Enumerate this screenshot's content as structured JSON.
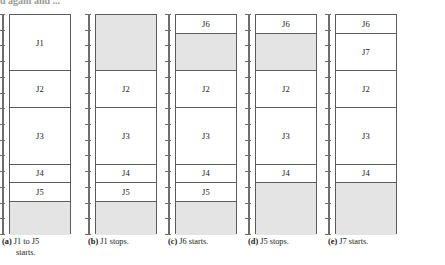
{
  "figure": {
    "top_cut_text": "d again and ...",
    "axis": {
      "tick_count": 14,
      "line_color": "#6d6d6d"
    },
    "colors": {
      "free_block": "#e4e4e4",
      "used_block": "#ffffff",
      "border": "#5c5c5c"
    },
    "memory_total_units": 14,
    "panels": [
      {
        "id": "a",
        "caption_label": "(a)",
        "caption_line1": "J1 to J5",
        "caption_line2": "starts.",
        "blocks": [
          {
            "label": "J1",
            "state": "used",
            "top_pct": 0.0,
            "height_pct": 25.5
          },
          {
            "label": "J2",
            "state": "used",
            "top_pct": 25.5,
            "height_pct": 17.0
          },
          {
            "label": "J3",
            "state": "used",
            "top_pct": 42.5,
            "height_pct": 25.5
          },
          {
            "label": "J4",
            "state": "used",
            "top_pct": 68.0,
            "height_pct": 8.5
          },
          {
            "label": "J5",
            "state": "used",
            "top_pct": 76.5,
            "height_pct": 8.5
          },
          {
            "label": "",
            "state": "free",
            "top_pct": 85.0,
            "height_pct": 15.0
          }
        ]
      },
      {
        "id": "b",
        "caption_label": "(b)",
        "caption_line1": "J1 stops.",
        "caption_line2": "",
        "blocks": [
          {
            "label": "",
            "state": "free",
            "top_pct": 0.0,
            "height_pct": 25.5
          },
          {
            "label": "J2",
            "state": "used",
            "top_pct": 25.5,
            "height_pct": 17.0
          },
          {
            "label": "J3",
            "state": "used",
            "top_pct": 42.5,
            "height_pct": 25.5
          },
          {
            "label": "J4",
            "state": "used",
            "top_pct": 68.0,
            "height_pct": 8.5
          },
          {
            "label": "J5",
            "state": "used",
            "top_pct": 76.5,
            "height_pct": 8.5
          },
          {
            "label": "",
            "state": "free",
            "top_pct": 85.0,
            "height_pct": 15.0
          }
        ]
      },
      {
        "id": "c",
        "caption_label": "(c)",
        "caption_line1": "J6 starts.",
        "caption_line2": "",
        "blocks": [
          {
            "label": "J6",
            "state": "used",
            "top_pct": 0.0,
            "height_pct": 8.5
          },
          {
            "label": "",
            "state": "free",
            "top_pct": 8.5,
            "height_pct": 17.0
          },
          {
            "label": "J2",
            "state": "used",
            "top_pct": 25.5,
            "height_pct": 17.0
          },
          {
            "label": "J3",
            "state": "used",
            "top_pct": 42.5,
            "height_pct": 25.5
          },
          {
            "label": "J4",
            "state": "used",
            "top_pct": 68.0,
            "height_pct": 8.5
          },
          {
            "label": "J5",
            "state": "used",
            "top_pct": 76.5,
            "height_pct": 8.5
          },
          {
            "label": "",
            "state": "free",
            "top_pct": 85.0,
            "height_pct": 15.0
          }
        ]
      },
      {
        "id": "d",
        "caption_label": "(d)",
        "caption_line1": "J5 stops.",
        "caption_line2": "",
        "blocks": [
          {
            "label": "J6",
            "state": "used",
            "top_pct": 0.0,
            "height_pct": 8.5
          },
          {
            "label": "",
            "state": "free",
            "top_pct": 8.5,
            "height_pct": 17.0
          },
          {
            "label": "J2",
            "state": "used",
            "top_pct": 25.5,
            "height_pct": 17.0
          },
          {
            "label": "J3",
            "state": "used",
            "top_pct": 42.5,
            "height_pct": 25.5
          },
          {
            "label": "J4",
            "state": "used",
            "top_pct": 68.0,
            "height_pct": 8.5
          },
          {
            "label": "",
            "state": "free",
            "top_pct": 76.5,
            "height_pct": 23.5
          }
        ]
      },
      {
        "id": "e",
        "caption_label": "(e)",
        "caption_line1": "J7 starts.",
        "caption_line2": "",
        "blocks": [
          {
            "label": "J6",
            "state": "used",
            "top_pct": 0.0,
            "height_pct": 8.5
          },
          {
            "label": "J7",
            "state": "used",
            "top_pct": 8.5,
            "height_pct": 17.0
          },
          {
            "label": "J2",
            "state": "used",
            "top_pct": 25.5,
            "height_pct": 17.0
          },
          {
            "label": "J3",
            "state": "used",
            "top_pct": 42.5,
            "height_pct": 25.5
          },
          {
            "label": "J4",
            "state": "used",
            "top_pct": 68.0,
            "height_pct": 8.5
          },
          {
            "label": "",
            "state": "free",
            "top_pct": 76.5,
            "height_pct": 23.5
          }
        ]
      }
    ]
  }
}
